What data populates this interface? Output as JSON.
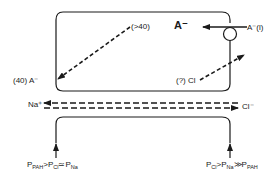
{
  "diagram": {
    "type": "epithelial transport schematic",
    "colors": {
      "ink": "#1a1a1a",
      "background": "#ffffff"
    },
    "cell": {
      "intracellular_anion": "A⁻",
      "carrier": {
        "shape": "circle",
        "substrate_label": "A⁻(l)"
      },
      "transcellular_fluxes": [
        {
          "label_start": "(>40)",
          "label_end": "(40) A⁻",
          "direction": "from upper-right to lower-left",
          "style": "dashed"
        },
        {
          "label_start": "(?) Cl",
          "direction": "from lower-left to upper-right, exits right",
          "style": "dashed"
        }
      ]
    },
    "paracellular": {
      "left_ion": "Na⁺",
      "right_ion": "Cl⁻",
      "arrows": [
        {
          "direction": "right-to-left",
          "ion": "Na⁺",
          "style": "dashed"
        },
        {
          "direction": "left-to-right",
          "ion": "Cl⁻",
          "style": "dashed"
        }
      ]
    },
    "permeability_relations": {
      "left": {
        "P": "P",
        "s1": "PAH",
        "op1": ">",
        "s2": "Cl",
        "op2": "≃",
        "s3": "Na"
      },
      "right": {
        "P": "P",
        "s1": "Cl",
        "op1": ">",
        "s2": "Na",
        "op2": "≫",
        "s3": "PAH"
      }
    }
  }
}
